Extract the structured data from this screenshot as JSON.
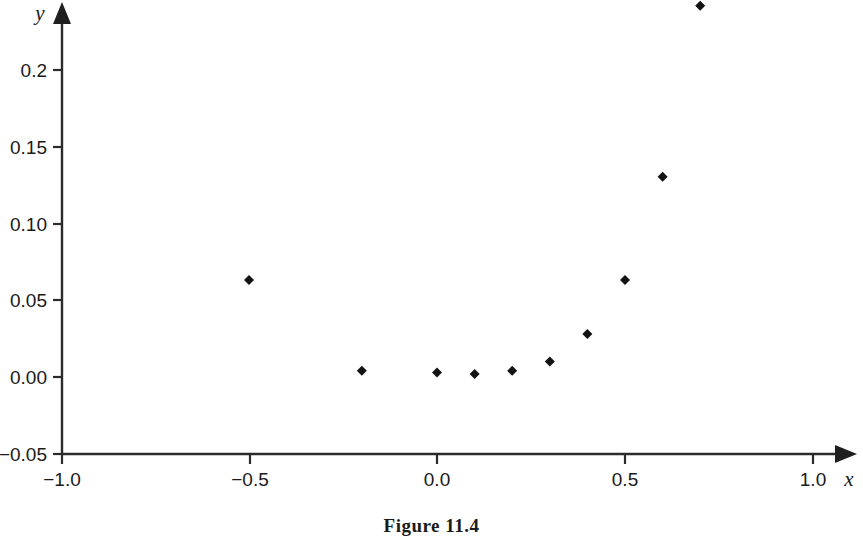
{
  "figure": {
    "caption": "Figure 11.4"
  },
  "chart_data": {
    "type": "scatter",
    "title": "",
    "xlabel": "x",
    "ylabel": "y",
    "xlim": [
      -1.0,
      1.05
    ],
    "ylim": [
      -0.05,
      0.225
    ],
    "grid": false,
    "legend": null,
    "xticks": [
      -1.0,
      -0.5,
      0.0,
      0.5,
      1.0
    ],
    "xticklabels": [
      "−1.0",
      "−0.5",
      "0.0",
      "0.5",
      "1.0"
    ],
    "yticks": [
      -0.05,
      0.0,
      0.05,
      0.1,
      0.15,
      0.2
    ],
    "yticklabels": [
      "−0.05",
      "0.00",
      "0.05",
      "0.10",
      "0.15",
      "0.2"
    ],
    "marker": "diamond",
    "marker_color": "#131313",
    "x": [
      -0.5,
      -0.2,
      0.0,
      0.1,
      0.2,
      0.3,
      0.4,
      0.5,
      0.6,
      0.7
    ],
    "y": [
      0.063,
      0.004,
      0.003,
      0.002,
      0.004,
      0.01,
      0.028,
      0.063,
      0.13,
      0.241
    ],
    "points": [
      {
        "x": -0.5,
        "y": 0.063
      },
      {
        "x": -0.2,
        "y": 0.004
      },
      {
        "x": 0.0,
        "y": 0.003
      },
      {
        "x": 0.1,
        "y": 0.002
      },
      {
        "x": 0.2,
        "y": 0.004
      },
      {
        "x": 0.3,
        "y": 0.01
      },
      {
        "x": 0.4,
        "y": 0.028
      },
      {
        "x": 0.5,
        "y": 0.063
      },
      {
        "x": 0.6,
        "y": 0.13
      },
      {
        "x": 0.7,
        "y": 0.241
      }
    ],
    "axis_arrows": {
      "x": true,
      "y": true
    }
  }
}
